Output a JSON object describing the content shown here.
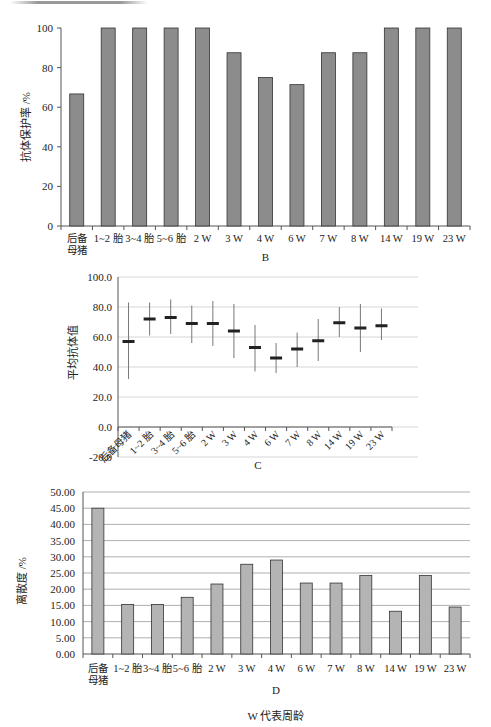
{
  "categories": [
    "后备母猪",
    "1~2 胎",
    "3~4 胎",
    "5~6 胎",
    "2 W",
    "3 W",
    "4 W",
    "6 W",
    "7 W",
    "8 W",
    "14 W",
    "19 W",
    "23 W"
  ],
  "category_lines": [
    [
      "后备",
      "母猪"
    ],
    [
      "1~2 胎"
    ],
    [
      "3~4 胎"
    ],
    [
      "5~6 胎"
    ],
    [
      "2 W"
    ],
    [
      "3 W"
    ],
    [
      "4 W"
    ],
    [
      "6 W"
    ],
    [
      "7 W"
    ],
    [
      "8 W"
    ],
    [
      "14 W"
    ],
    [
      "19 W"
    ],
    [
      "23 W"
    ]
  ],
  "footnote": "W 代表周龄",
  "chart_data": [
    {
      "id": "B",
      "type": "bar",
      "title": "",
      "caption": "B",
      "xlabel": "",
      "ylabel": "抗体保护率 /%",
      "categories": [
        "后备母猪",
        "1~2 胎",
        "3~4 胎",
        "5~6 胎",
        "2 W",
        "3 W",
        "4 W",
        "6 W",
        "7 W",
        "8 W",
        "14 W",
        "19 W",
        "23 W"
      ],
      "values": [
        66.7,
        100,
        100,
        100,
        100,
        87.5,
        75,
        71.4,
        87.5,
        87.5,
        100,
        100,
        100
      ],
      "ylim": [
        0,
        100
      ],
      "yticks": [
        "0",
        "20",
        "40",
        "60",
        "80",
        "100"
      ],
      "grid": false,
      "bar_color": "#8c8c8c"
    },
    {
      "id": "C",
      "type": "scatter",
      "subtype": "mean-with-range",
      "caption": "C",
      "xlabel": "",
      "ylabel": "平均抗体值",
      "categories": [
        "后备母猪",
        "1~2 胎",
        "3~4 胎",
        "5~6 胎",
        "2 W",
        "3 W",
        "4 W",
        "6 W",
        "7 W",
        "8 W",
        "14 W",
        "19 W",
        "23 W"
      ],
      "mean": [
        57,
        72,
        73,
        69,
        69,
        64,
        53,
        46,
        52,
        57.5,
        69.5,
        66,
        67.5
      ],
      "max": [
        83,
        83,
        85,
        81,
        84,
        82,
        68,
        56,
        63,
        72,
        80,
        82,
        79
      ],
      "min": [
        32,
        61,
        62,
        56,
        54,
        46,
        37,
        36,
        40,
        44,
        60,
        50,
        58
      ],
      "ylim": [
        -20,
        100
      ],
      "yticks": [
        "-20.0",
        "0.0",
        "20.0",
        "40.0",
        "60.0",
        "80.0",
        "100.0"
      ],
      "grid": true,
      "xtick_rotation": -45
    },
    {
      "id": "D",
      "type": "bar",
      "caption": "D",
      "xlabel": "W 代表周龄",
      "ylabel": "离散度 /%",
      "categories": [
        "后备母猪",
        "1~2 胎",
        "3~4 胎",
        "5~6 胎",
        "2 W",
        "3 W",
        "4 W",
        "6 W",
        "7 W",
        "8 W",
        "14 W",
        "19 W",
        "23 W"
      ],
      "values": [
        45.0,
        15.3,
        15.3,
        17.5,
        21.6,
        27.7,
        29.0,
        21.9,
        21.9,
        24.2,
        13.2,
        24.2,
        14.5
      ],
      "ylim": [
        0,
        50
      ],
      "yticks": [
        "0.00",
        "5.00",
        "10.00",
        "15.00",
        "20.00",
        "25.00",
        "30.00",
        "35.00",
        "40.00",
        "45.00",
        "50.00"
      ],
      "grid": true,
      "bar_color": "#b4b4b4"
    }
  ]
}
